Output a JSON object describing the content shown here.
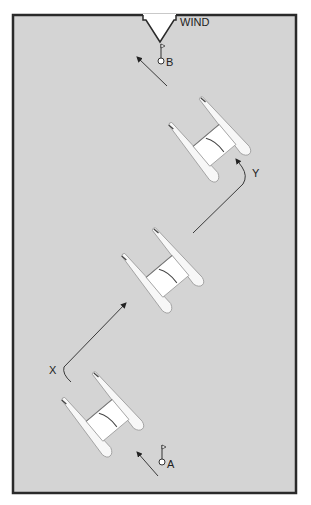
{
  "labels": {
    "wind": "WIND",
    "start_mark": "A",
    "finish_mark": "B",
    "tack_point_1": "X",
    "tack_point_2": "Y"
  },
  "colors": {
    "water": "#d4d4d4",
    "frame": "#2a2a2a",
    "hull": "#f7f7f7",
    "hull_outline": "#9a9a9a",
    "tramp": "#ffffff",
    "line": "#3a3a3a"
  },
  "boats": [
    {
      "id": "boat-start",
      "cx": 103,
      "cy": 415,
      "angle": -40
    },
    {
      "id": "boat-mid",
      "cx": 163,
      "cy": 270,
      "angle": -40
    },
    {
      "id": "boat-top",
      "cx": 210,
      "cy": 140,
      "angle": -40
    }
  ]
}
